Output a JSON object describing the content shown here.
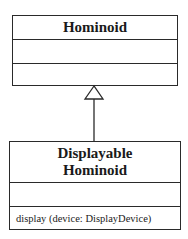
{
  "diagram": {
    "type": "uml-class-inheritance",
    "superclass": {
      "name": "Hominoid",
      "attributes": [],
      "operations": []
    },
    "subclass": {
      "name_lines": [
        "Displayable",
        "Hominoid"
      ],
      "attributes": [],
      "operations": [
        "display (device: DisplayDevice)"
      ]
    },
    "relationship": {
      "kind": "generalization",
      "from": "Displayable Hominoid",
      "to": "Hominoid",
      "arrowhead": "hollow-triangle"
    }
  }
}
